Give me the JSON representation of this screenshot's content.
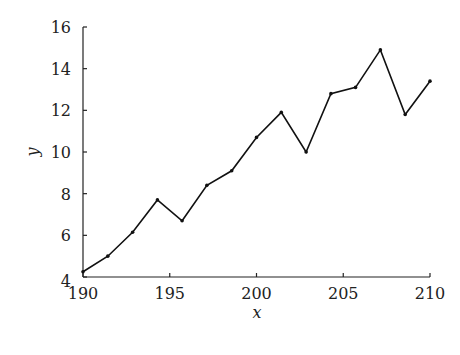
{
  "chart_data": {
    "type": "line",
    "title": "",
    "xlabel": "x",
    "ylabel": "y",
    "xlim": [
      190,
      210
    ],
    "ylim": [
      4,
      16
    ],
    "xticks": [
      190,
      195,
      200,
      205,
      210
    ],
    "yticks": [
      4,
      6,
      8,
      10,
      12,
      14,
      16
    ],
    "grid": false,
    "legend": null,
    "series": [
      {
        "name": "y",
        "color": "#111111",
        "marker": "dot",
        "x": [
          190,
          191.43,
          192.86,
          194.29,
          195.71,
          197.14,
          198.57,
          200,
          201.43,
          202.86,
          204.29,
          205.71,
          207.14,
          208.57,
          210
        ],
        "y": [
          4.25,
          5.0,
          6.15,
          7.7,
          6.7,
          8.4,
          9.1,
          10.7,
          11.9,
          10.0,
          12.8,
          13.1,
          14.9,
          11.8,
          13.4
        ]
      }
    ]
  },
  "axes": {
    "x_label": "x",
    "y_label": "y"
  }
}
